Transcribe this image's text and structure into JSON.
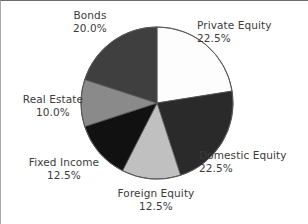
{
  "chart_data": {
    "type": "pie",
    "title": "",
    "subtitle": "",
    "xlabel": "",
    "ylabel": "",
    "legend_position": "none",
    "grid": false,
    "start_angle_deg": 0,
    "direction": "clockwise",
    "categories": [
      "Private Equity",
      "Domestic Equity",
      "Foreign Equity",
      "Fixed Income",
      "Real Estate",
      "Bonds"
    ],
    "values": [
      22.5,
      22.5,
      12.5,
      12.5,
      10.0,
      20.0
    ],
    "value_labels": [
      "22.5%",
      "22.5%",
      "12.5%",
      "12.5%",
      "10.0%",
      "20.0%"
    ],
    "colors": [
      "#fdfdfd",
      "#2a2a2a",
      "#c0c0c0",
      "#111111",
      "#8a8a8a",
      "#3f3f3f"
    ],
    "slices": [
      {
        "name": "Private Equity",
        "value": 22.5,
        "value_label": "22.5%",
        "color": "#fdfdfd"
      },
      {
        "name": "Domestic Equity",
        "value": 22.5,
        "value_label": "22.5%",
        "color": "#2a2a2a"
      },
      {
        "name": "Foreign Equity",
        "value": 12.5,
        "value_label": "12.5%",
        "color": "#c0c0c0"
      },
      {
        "name": "Fixed Income",
        "value": 12.5,
        "value_label": "12.5%",
        "color": "#111111"
      },
      {
        "name": "Real Estate",
        "value": 10.0,
        "value_label": "10.0%",
        "color": "#8a8a8a"
      },
      {
        "name": "Bonds",
        "value": 20.0,
        "value_label": "20.0%",
        "color": "#3f3f3f"
      }
    ]
  },
  "labels": {
    "private_equity": {
      "name": "Private Equity",
      "value": "22.5%"
    },
    "domestic_equity": {
      "name": "Domestic Equity",
      "value": "22.5%"
    },
    "foreign_equity": {
      "name": "Foreign Equity",
      "value": "12.5%"
    },
    "fixed_income": {
      "name": "Fixed Income",
      "value": "12.5%"
    },
    "real_estate": {
      "name": "Real Estate",
      "value": "10.0%"
    },
    "bonds": {
      "name": "Bonds",
      "value": "20.0%"
    }
  },
  "style": {
    "background": "#ffffff",
    "text_color": "#3b3b3b",
    "outline_color": "#555555"
  }
}
